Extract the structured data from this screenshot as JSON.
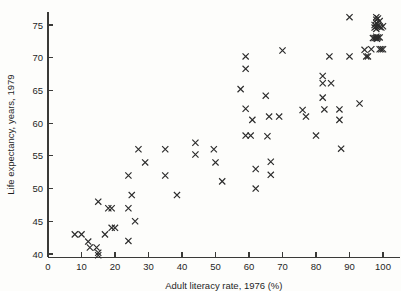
{
  "chart_data": {
    "type": "scatter",
    "title": "",
    "xlabel": "Adult literacy rate, 1976 (%)",
    "ylabel": "Life expectancy, years, 1979",
    "xlim": [
      0,
      105
    ],
    "ylim": [
      39.5,
      77
    ],
    "grid": false,
    "legend": null,
    "marker": "x",
    "marker_color": "#2b2b2b",
    "xticks": [
      0,
      10,
      20,
      30,
      40,
      50,
      60,
      70,
      80,
      90,
      100
    ],
    "xticklabels": [
      "0",
      "10",
      "20",
      "30",
      "40",
      "50",
      "60",
      "70",
      "80",
      "90",
      "100"
    ],
    "yticks": [
      40,
      45,
      50,
      55,
      60,
      65,
      70,
      75
    ],
    "yticklabels": [
      "40",
      "45",
      "50",
      "55",
      "60",
      "65",
      "70",
      "75"
    ],
    "points": [
      [
        8,
        43.0
      ],
      [
        10,
        43.0
      ],
      [
        12,
        41.9
      ],
      [
        12.5,
        41.0
      ],
      [
        14.5,
        41.0
      ],
      [
        15,
        40.2
      ],
      [
        15,
        39.8
      ],
      [
        15,
        48.0
      ],
      [
        17,
        43.0
      ],
      [
        18,
        47.0
      ],
      [
        19,
        47.0
      ],
      [
        19,
        44.0
      ],
      [
        20,
        44.0
      ],
      [
        24,
        47.0
      ],
      [
        24,
        42.0
      ],
      [
        24,
        52.0
      ],
      [
        25,
        49.0
      ],
      [
        26,
        45.0
      ],
      [
        27,
        56.0
      ],
      [
        29,
        54.0
      ],
      [
        35,
        56.0
      ],
      [
        35,
        52.0
      ],
      [
        38.5,
        49.0
      ],
      [
        44,
        57.0
      ],
      [
        44,
        55.2
      ],
      [
        49.5,
        56.0
      ],
      [
        50,
        54.0
      ],
      [
        52,
        51.1
      ],
      [
        57.5,
        65.2
      ],
      [
        59,
        70.2
      ],
      [
        59,
        68.3
      ],
      [
        59,
        62.2
      ],
      [
        59,
        58.1
      ],
      [
        60.5,
        58.1
      ],
      [
        61,
        60.5
      ],
      [
        62,
        53.0
      ],
      [
        62,
        50.0
      ],
      [
        65,
        64.2
      ],
      [
        65.5,
        58.0
      ],
      [
        66,
        61.0
      ],
      [
        66.5,
        54.1
      ],
      [
        66.5,
        52.1
      ],
      [
        69,
        61.0
      ],
      [
        70,
        71.1
      ],
      [
        76,
        62.0
      ],
      [
        77,
        61.0
      ],
      [
        80,
        58.1
      ],
      [
        82,
        67.2
      ],
      [
        82,
        66.1
      ],
      [
        82,
        63.9
      ],
      [
        82.5,
        62.1
      ],
      [
        84,
        70.2
      ],
      [
        84.5,
        66.1
      ],
      [
        87,
        62.1
      ],
      [
        87,
        60.5
      ],
      [
        87.5,
        56.1
      ],
      [
        90,
        76.2
      ],
      [
        90,
        70.2
      ],
      [
        93,
        63.0
      ],
      [
        94.5,
        71.2
      ],
      [
        95,
        70.2
      ],
      [
        95.5,
        70.2
      ],
      [
        96.5,
        71.3
      ],
      [
        97,
        73.0
      ],
      [
        97.5,
        73.0
      ],
      [
        97.5,
        75.0
      ],
      [
        97.5,
        74.6
      ],
      [
        98,
        76.2
      ],
      [
        98,
        75.8
      ],
      [
        98,
        75.3
      ],
      [
        98,
        74.8
      ],
      [
        98,
        74.4
      ],
      [
        98,
        73.2
      ],
      [
        98,
        73.0
      ],
      [
        98.2,
        72.9
      ],
      [
        98.5,
        76.0
      ],
      [
        98.5,
        74.9
      ],
      [
        98.5,
        73.1
      ],
      [
        99,
        75.6
      ],
      [
        99,
        74.7
      ],
      [
        99,
        73.1
      ],
      [
        99,
        71.3
      ],
      [
        99.5,
        74.6
      ],
      [
        99.5,
        71.3
      ],
      [
        100,
        74.8
      ],
      [
        100,
        71.3
      ]
    ]
  }
}
